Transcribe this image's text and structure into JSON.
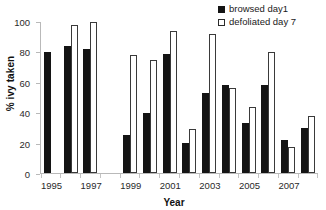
{
  "chart_data": {
    "type": "bar",
    "title": "",
    "xlabel": "Year",
    "ylabel": "% ivy taken",
    "ylim": [
      0,
      100
    ],
    "yticks": [
      0,
      20,
      40,
      60,
      80,
      100
    ],
    "grid": false,
    "legend_position": "top-right",
    "categories": [
      "1995",
      "1996",
      "1997",
      "1998",
      "1999",
      "2000",
      "2001",
      "2002",
      "2003",
      "2004",
      "2005",
      "2006",
      "2007",
      "2008"
    ],
    "tick_labels": [
      "1995",
      "",
      "1997",
      "",
      "1999",
      "",
      "2001",
      "",
      "2003",
      "",
      "2005",
      "",
      "2007",
      ""
    ],
    "series": [
      {
        "name": "browsed day1",
        "style": "filled",
        "color": "#141414",
        "values": [
          80,
          84,
          82,
          null,
          25,
          40,
          79,
          20,
          53,
          58,
          33,
          58,
          22,
          30
        ]
      },
      {
        "name": "defoliated day 7",
        "style": "hollow",
        "color": "#ffffff",
        "edge_color": "#3a3a3a",
        "values": [
          null,
          98,
          100,
          null,
          78,
          75,
          94,
          29,
          92,
          56,
          44,
          80,
          17,
          38
        ]
      }
    ]
  },
  "legend": {
    "items": [
      {
        "label": "browsed day1",
        "swatch": "filled-square-icon"
      },
      {
        "label": "defoliated day 7",
        "swatch": "hollow-square-icon"
      }
    ]
  },
  "axes": {
    "y_title": "% ivy taken",
    "x_title": "Year"
  }
}
